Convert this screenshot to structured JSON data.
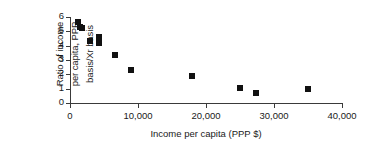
{
  "chart_data": {
    "type": "scatter",
    "title": "",
    "xlabel": "Income per capita (PPP $)",
    "ylabel": "Ratio of income per capita, PPP basis/Xr basis",
    "ylabel_lines": [
      "Ratio of income",
      "per capita, PPP",
      "basis/Xr basis"
    ],
    "xlim": [
      0,
      40000
    ],
    "ylim": [
      0,
      6
    ],
    "xticks": [
      0,
      10000,
      20000,
      30000,
      40000
    ],
    "xtick_labels": [
      "0",
      "10,000",
      "20,000",
      "30,000",
      "40,000"
    ],
    "yticks": [
      0,
      1,
      2,
      3,
      4,
      5,
      6
    ],
    "ytick_labels": [
      "0",
      "1",
      "2",
      "3",
      "4",
      "5",
      "6"
    ],
    "grid": false,
    "legend": null,
    "marker_color": "#111111",
    "axis_color": "#3a3a3a",
    "points": [
      {
        "x": 1200,
        "y": 5.65
      },
      {
        "x": 1400,
        "y": 5.3
      },
      {
        "x": 1800,
        "y": 5.25
      },
      {
        "x": 2900,
        "y": 4.35
      },
      {
        "x": 4200,
        "y": 4.6
      },
      {
        "x": 4300,
        "y": 4.45
      },
      {
        "x": 4300,
        "y": 4.2
      },
      {
        "x": 6600,
        "y": 3.35
      },
      {
        "x": 9000,
        "y": 2.3
      },
      {
        "x": 18000,
        "y": 1.9
      },
      {
        "x": 25000,
        "y": 1.05
      },
      {
        "x": 27400,
        "y": 0.7
      },
      {
        "x": 35000,
        "y": 0.95
      }
    ]
  }
}
